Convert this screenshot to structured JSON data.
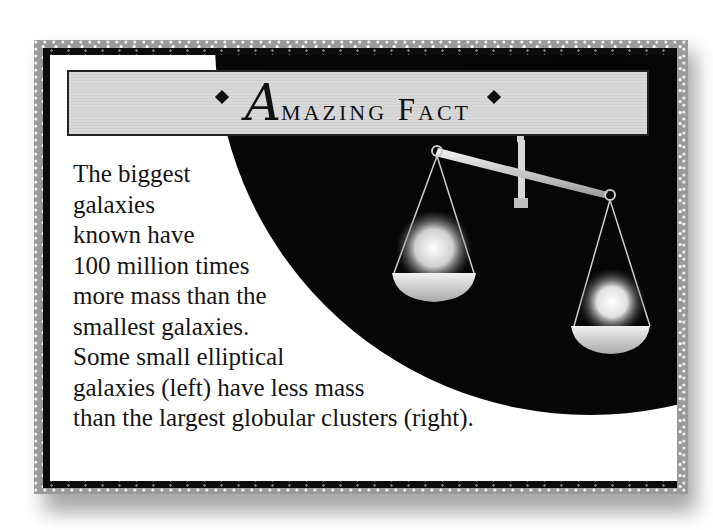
{
  "card": {
    "title_initial": "A",
    "title_rest": "mazing Fact",
    "left_ornament": "diamond",
    "right_ornament": "diamond"
  },
  "body": {
    "lines": [
      "The biggest",
      "galaxies",
      "known have",
      "100 million times",
      "more mass than the",
      "smallest galaxies.",
      "Some small elliptical",
      "galaxies (left) have less mass",
      "than the largest globular clusters (right)."
    ]
  },
  "illustration": {
    "subject": "balance-scale",
    "left_pan": "small elliptical galaxy",
    "right_pan": "globular cluster",
    "colors": {
      "background": "#070707",
      "banner": "#d6d6d6",
      "frame": "#9a9a9a"
    }
  }
}
